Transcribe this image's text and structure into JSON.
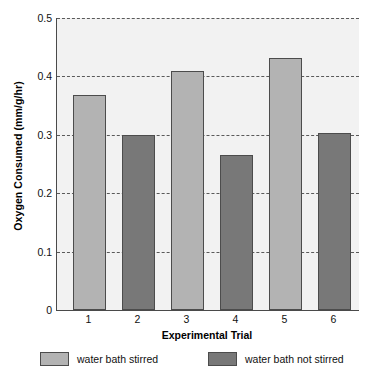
{
  "chart_data": {
    "type": "bar",
    "title": "",
    "xlabel": "Experimental Trial",
    "ylabel": "Oxygen Consumed (mm/g/hr)",
    "categories": [
      "1",
      "2",
      "3",
      "4",
      "5",
      "6"
    ],
    "values": [
      0.368,
      0.3,
      0.41,
      0.266,
      0.431,
      0.303
    ],
    "bar_groups": [
      {
        "category": "1",
        "value": 0.368,
        "series": "water bath stirred"
      },
      {
        "category": "2",
        "value": 0.3,
        "series": "water bath not stirred"
      },
      {
        "category": "3",
        "value": 0.41,
        "series": "water bath stirred"
      },
      {
        "category": "4",
        "value": 0.266,
        "series": "water bath not stirred"
      },
      {
        "category": "5",
        "value": 0.431,
        "series": "water bath stirred"
      },
      {
        "category": "6",
        "value": 0.303,
        "series": "water bath not stirred"
      }
    ],
    "ylim": [
      0,
      0.5
    ],
    "yticks": [
      0,
      0.1,
      0.2,
      0.3,
      0.4,
      0.5
    ],
    "ytick_labels": [
      "0",
      "0.1",
      "0.2",
      "0.3",
      "0.4",
      "0.5"
    ],
    "xtick_labels": [
      "1",
      "2",
      "3",
      "4",
      "5",
      "6"
    ],
    "grid": "horizontal-dashed",
    "legend_position": "below-plot",
    "legend": [
      {
        "label": "water bath stirred",
        "color": "#b3b3b3"
      },
      {
        "label": "water bath not stirred",
        "color": "#787878"
      }
    ],
    "colors": {
      "stirred": "#b3b3b3",
      "not_stirred": "#787878",
      "plot_background": "#f2f2f2",
      "axis": "#4a4a4a",
      "gridline": "#5a5a5a",
      "bar_outline": "#4c4c4c"
    }
  }
}
